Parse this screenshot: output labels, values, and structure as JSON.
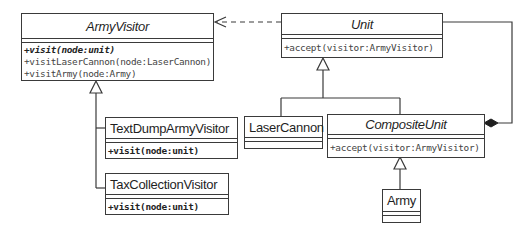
{
  "diagram": {
    "type": "UML class diagram",
    "classes": {
      "army_visitor": {
        "name": "ArmyVisitor",
        "abstract": true,
        "operations": [
          "+visit(node:unit)",
          "+visitLaserCannon(node:LaserCannon)",
          "+visitArmy(node:Army)"
        ]
      },
      "unit": {
        "name": "Unit",
        "abstract": true,
        "operations": [
          "+accept(visitor:ArmyVisitor)"
        ]
      },
      "text_dump": {
        "name": "TextDumpArmyVisitor",
        "abstract": false,
        "operations": [
          "+visit(node:unit)"
        ]
      },
      "tax_collection": {
        "name": "TaxCollectionVisitor",
        "abstract": false,
        "operations": [
          "+visit(node:unit)"
        ]
      },
      "laser_cannon": {
        "name": "LaserCannon",
        "abstract": false,
        "operations": []
      },
      "composite_unit": {
        "name": "CompositeUnit",
        "abstract": true,
        "operations": [
          "+accept(visitor:ArmyVisitor)"
        ]
      },
      "army": {
        "name": "Army",
        "abstract": false,
        "operations": []
      }
    },
    "relationships": [
      {
        "type": "dependency",
        "from": "Unit",
        "to": "ArmyVisitor"
      },
      {
        "type": "generalization",
        "from": "TextDumpArmyVisitor",
        "to": "ArmyVisitor"
      },
      {
        "type": "generalization",
        "from": "TaxCollectionVisitor",
        "to": "ArmyVisitor"
      },
      {
        "type": "generalization",
        "from": "LaserCannon",
        "to": "Unit"
      },
      {
        "type": "generalization",
        "from": "CompositeUnit",
        "to": "Unit"
      },
      {
        "type": "generalization",
        "from": "Army",
        "to": "CompositeUnit"
      },
      {
        "type": "composition",
        "from": "CompositeUnit",
        "to": "Unit"
      }
    ],
    "colors": {
      "line": "#3a3a3a",
      "background": "#ffffff",
      "text": "#1f1f1f"
    }
  }
}
